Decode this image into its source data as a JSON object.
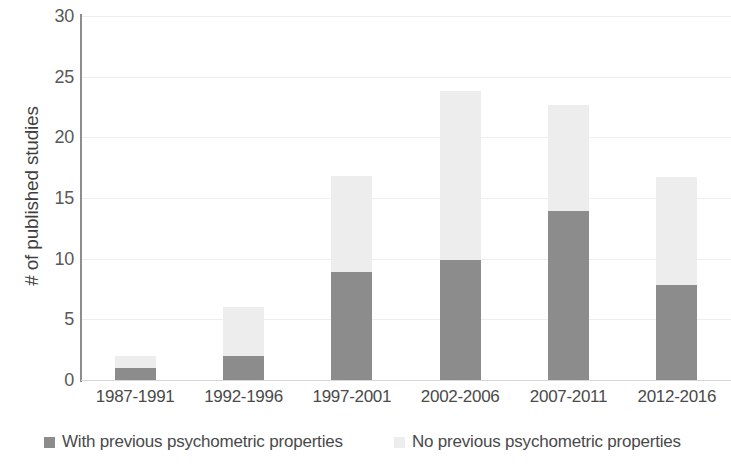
{
  "chart_data": {
    "type": "bar",
    "subtype": "stacked-bar",
    "title": "",
    "subtitle": "",
    "xlabel": "",
    "ylabel": "# of published studies",
    "categories": [
      "1987-1991",
      "1992-1996",
      "1997-2001",
      "2002-2006",
      "2007-2011",
      "2012-2016"
    ],
    "series": [
      {
        "name": "With previous psychometric properties",
        "color": "#8c8c8c",
        "values": [
          1,
          2,
          8.9,
          9.9,
          13.9,
          7.8
        ]
      },
      {
        "name": "No previous psychometric properties",
        "color": "#ededed",
        "values": [
          1,
          4,
          7.9,
          13.9,
          8.8,
          8.9
        ]
      }
    ],
    "totals": [
      2,
      6,
      16.8,
      23.8,
      22.7,
      16.7
    ],
    "ylim": [
      0,
      30
    ],
    "yticks": [
      0,
      5,
      10,
      15,
      20,
      25,
      30
    ],
    "ytick_labels": [
      "0",
      "5",
      "10",
      "15",
      "20",
      "25",
      "30"
    ],
    "grid": "horizontal",
    "grid_color": "#eceff1",
    "legend_position": "bottom",
    "axis_color": "#8d8d8d",
    "background": "#ffffff"
  },
  "legend": {
    "items": [
      {
        "label": "With previous psychometric properties",
        "color": "#8c8c8c"
      },
      {
        "label": "No previous psychometric properties",
        "color": "#ededed"
      }
    ]
  }
}
